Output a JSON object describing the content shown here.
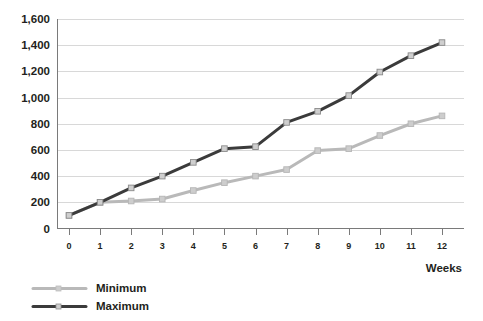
{
  "chart_data": {
    "type": "line",
    "title": "",
    "subtitle": "",
    "xlabel": "Weeks",
    "ylabel": "",
    "x": [
      0,
      1,
      2,
      3,
      4,
      5,
      6,
      7,
      8,
      9,
      10,
      11,
      12
    ],
    "categories": [
      "0",
      "1",
      "2",
      "3",
      "4",
      "5",
      "6",
      "7",
      "8",
      "9",
      "10",
      "11",
      "12"
    ],
    "series": [
      {
        "name": "Minimum",
        "color": "#b9b9b9",
        "marker": "square",
        "values": [
          100,
          200,
          210,
          225,
          290,
          350,
          400,
          450,
          595,
          610,
          710,
          800,
          860
        ]
      },
      {
        "name": "Maximum",
        "color": "#3b3b3b",
        "marker": "square",
        "values": [
          100,
          200,
          310,
          400,
          505,
          610,
          625,
          810,
          895,
          1015,
          1195,
          1320,
          1420
        ]
      }
    ],
    "ylim": [
      0,
      1600
    ],
    "xlim": [
      0,
      12
    ],
    "yticks": [
      0,
      200,
      400,
      600,
      800,
      1000,
      1200,
      1400,
      1600
    ],
    "ytick_labels": [
      "0",
      "200",
      "400",
      "600",
      "800",
      "1,000",
      "1,200",
      "1,400",
      "1,600"
    ],
    "xticks": [
      0,
      1,
      2,
      3,
      4,
      5,
      6,
      7,
      8,
      9,
      10,
      11,
      12
    ],
    "xtick_labels": [
      "0",
      "1",
      "2",
      "3",
      "4",
      "5",
      "6",
      "7",
      "8",
      "9",
      "10",
      "11",
      "12"
    ],
    "grid": {
      "horizontal": true,
      "vertical": false,
      "color": "#d8d8d8"
    },
    "legend": {
      "position": "bottom-left",
      "entries": [
        {
          "label": "Minimum",
          "color": "#b9b9b9"
        },
        {
          "label": "Maximum",
          "color": "#3b3b3b"
        }
      ]
    },
    "colors": {
      "background": "#ffffff",
      "axis": "#7a7a7a",
      "text": "#231f20",
      "grid": "#d8d8d8",
      "minimum": "#b9b9b9",
      "maximum": "#3b3b3b"
    }
  }
}
